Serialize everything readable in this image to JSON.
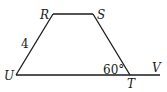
{
  "diagram": {
    "type": "trapezoid",
    "vertices": {
      "R": {
        "label": "R",
        "x": 53,
        "y": 14
      },
      "S": {
        "label": "S",
        "x": 93,
        "y": 14
      },
      "T": {
        "label": "T",
        "x": 130,
        "y": 75
      },
      "U": {
        "label": "U",
        "x": 16,
        "y": 75
      },
      "V": {
        "label": "V",
        "x": 160,
        "y": 75
      }
    },
    "side_labels": {
      "UR": "4"
    },
    "angle_labels": {
      "STU": "60°"
    },
    "line_color": "#1a1a1a"
  }
}
